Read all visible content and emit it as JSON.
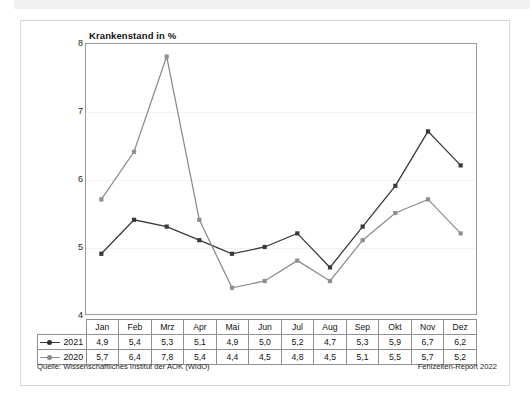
{
  "chart_data": {
    "type": "line",
    "title": "Krankenstand in %",
    "xlabel": "",
    "ylabel": "",
    "ylim": [
      4,
      8
    ],
    "yticks": [
      4,
      5,
      6,
      7,
      8
    ],
    "grid": true,
    "legend_position": "table-row-labels",
    "categories": [
      "Jan",
      "Feb",
      "Mrz",
      "Apr",
      "Mai",
      "Jun",
      "Jul",
      "Aug",
      "Sep",
      "Okt",
      "Nov",
      "Dez"
    ],
    "series": [
      {
        "name": "2021",
        "color": "#3a3a3a",
        "marker": "square",
        "values": [
          4.9,
          5.4,
          5.3,
          5.1,
          4.9,
          5.0,
          5.2,
          4.7,
          5.3,
          5.9,
          6.7,
          6.2
        ],
        "labels": [
          "4,9",
          "5,4",
          "5,3",
          "5,1",
          "4,9",
          "5,0",
          "5,2",
          "4,7",
          "5,3",
          "5,9",
          "6,7",
          "6,2"
        ]
      },
      {
        "name": "2020",
        "color": "#8e8e8e",
        "marker": "square",
        "values": [
          5.7,
          6.4,
          7.8,
          5.4,
          4.4,
          4.5,
          4.8,
          4.5,
          5.1,
          5.5,
          5.7,
          5.2
        ],
        "labels": [
          "5,7",
          "6,4",
          "7,8",
          "5,4",
          "4,4",
          "4,5",
          "4,8",
          "4,5",
          "5,1",
          "5,5",
          "5,7",
          "5,2"
        ]
      }
    ]
  },
  "footer": {
    "source": "Quelle: Wissenschaftliches Institut der AOK (WIdO)",
    "report": "Fehlzeiten-Report 2022"
  }
}
